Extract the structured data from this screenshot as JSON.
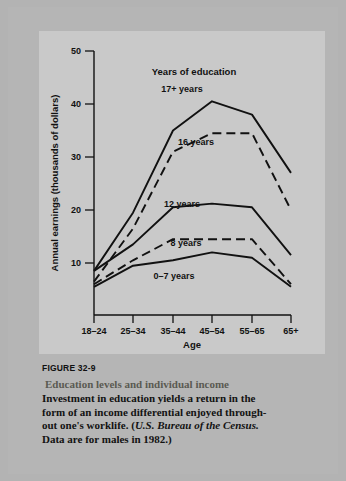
{
  "figure": {
    "number": "FIGURE 32-9",
    "title": "Education levels and individual income",
    "body_line1": "Investment in education yields a return in the",
    "body_line2": "form of an income differential enjoyed through-",
    "body_line3_pre": "out one's worklife. (",
    "body_line3_src": "U.S. Bureau of the Census.",
    "body_line4": "Data are for males in 1982.)"
  },
  "chart_data": {
    "type": "line",
    "title": "",
    "legend_title": "Years of education",
    "legend_position": "inline-labels",
    "xlabel": "Age",
    "ylabel": "Annual earnings (thousands of dollars)",
    "categories": [
      "18–24",
      "25–34",
      "35–44",
      "45–54",
      "55–65",
      "65+"
    ],
    "yticks": [
      10,
      20,
      30,
      40,
      50
    ],
    "ylim": [
      0,
      52
    ],
    "grid": false,
    "series": [
      {
        "name": "17+ years",
        "style": "solid",
        "values": [
          8.5,
          19.5,
          35.0,
          40.5,
          38.0,
          27.0
        ]
      },
      {
        "name": "16 years",
        "style": "dashed",
        "values": [
          6.5,
          16.5,
          31.0,
          34.5,
          34.5,
          20.0
        ]
      },
      {
        "name": "12 years",
        "style": "solid",
        "values": [
          8.5,
          13.5,
          20.5,
          21.2,
          20.5,
          11.5
        ]
      },
      {
        "name": "8 years",
        "style": "dashed",
        "values": [
          6.0,
          10.5,
          14.5,
          14.5,
          14.5,
          6.0
        ]
      },
      {
        "name": "0–7 years",
        "style": "solid",
        "values": [
          5.5,
          9.5,
          10.5,
          12.0,
          11.0,
          5.5
        ]
      }
    ],
    "series_label_positions": [
      {
        "name": "17+ years",
        "x": 143,
        "y": 61
      },
      {
        "name": "16 years",
        "x": 157,
        "y": 114
      },
      {
        "name": "12 years",
        "x": 143,
        "y": 176
      },
      {
        "name": "8 years",
        "x": 147,
        "y": 215
      },
      {
        "name": "0–7 years",
        "x": 135,
        "y": 248
      }
    ]
  },
  "colors": {
    "page_background": "#b3b3b3",
    "panel_background": "#c9c9c9",
    "ink": "#111111",
    "caption_title": "#5a5a52"
  }
}
